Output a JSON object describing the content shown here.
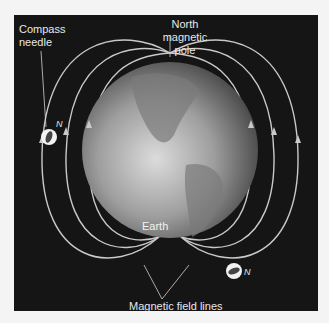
{
  "diagram": {
    "labels": {
      "compass_needle": "Compass\nneedle",
      "north_pole": "North\nmagnetic\npole",
      "earth": "Earth",
      "field_lines": "Magnetic field lines"
    },
    "compass_marker": "N",
    "colors": {
      "background": "#151515",
      "field_line": "#c9c9c9",
      "text": "#e8e8e8",
      "globe": "#9a9a9a"
    }
  }
}
